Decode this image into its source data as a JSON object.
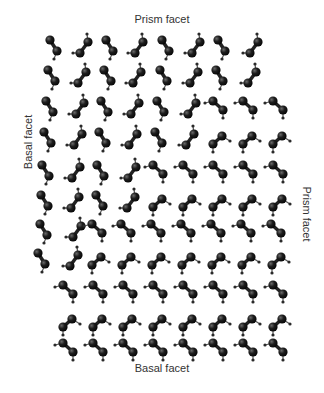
{
  "labels": {
    "top": "Prism facet",
    "bottom": "Basal facet",
    "left": "Basal facet",
    "right": "Prism facet"
  },
  "colors": {
    "oxygen": "#1a1a1a",
    "hydrogen": "#2a2a2a",
    "bond": "#555555",
    "text": "#333333"
  },
  "molecule_types": {
    "A": "prism-orientation-down",
    "B": "prism-orientation-up",
    "C": "basal-orientation-down",
    "D": "basal-orientation-up"
  },
  "rows": [
    {
      "y": 40,
      "molecules": [
        [
          "A",
          50
        ],
        [
          "B",
          80
        ],
        [
          "A",
          106
        ],
        [
          "B",
          135
        ],
        [
          "A",
          162
        ],
        [
          "B",
          192
        ],
        [
          "A",
          218
        ],
        [
          "B",
          250
        ]
      ]
    },
    {
      "y": 70,
      "molecules": [
        [
          "A",
          48
        ],
        [
          "B",
          78
        ],
        [
          "A",
          104
        ],
        [
          "B",
          133
        ],
        [
          "A",
          160
        ],
        [
          "B",
          190
        ],
        [
          "A",
          216
        ],
        [
          "B",
          248
        ]
      ]
    },
    {
      "y": 101,
      "molecules": [
        [
          "A",
          46
        ],
        [
          "B",
          76
        ],
        [
          "A",
          101
        ],
        [
          "B",
          131
        ],
        [
          "A",
          157
        ],
        [
          "B",
          188
        ],
        [
          "C",
          213
        ],
        [
          "C",
          243
        ],
        [
          "C",
          273
        ]
      ]
    },
    {
      "y": 132,
      "molecules": [
        [
          "A",
          44
        ],
        [
          "B",
          74
        ],
        [
          "A",
          99
        ],
        [
          "B",
          129
        ],
        [
          "A",
          155
        ],
        [
          "B",
          186
        ],
        [
          "D",
          213
        ],
        [
          "D",
          243
        ],
        [
          "D",
          273
        ]
      ]
    },
    {
      "y": 165,
      "molecules": [
        [
          "A",
          42
        ],
        [
          "B",
          72
        ],
        [
          "A",
          97
        ],
        [
          "B",
          128
        ],
        [
          "C",
          153
        ],
        [
          "C",
          183
        ],
        [
          "C",
          213
        ],
        [
          "C",
          243
        ],
        [
          "C",
          273
        ]
      ]
    },
    {
      "y": 195,
      "molecules": [
        [
          "A",
          41
        ],
        [
          "B",
          71
        ],
        [
          "A",
          96
        ],
        [
          "B",
          127
        ],
        [
          "D",
          153
        ],
        [
          "D",
          183
        ],
        [
          "D",
          213
        ],
        [
          "D",
          243
        ],
        [
          "D",
          273
        ]
      ]
    },
    {
      "y": 224,
      "molecules": [
        [
          "A",
          40
        ],
        [
          "B",
          73
        ],
        [
          "C",
          92
        ],
        [
          "C",
          121
        ],
        [
          "C",
          151
        ],
        [
          "C",
          181
        ],
        [
          "C",
          211
        ],
        [
          "C",
          241
        ],
        [
          "C",
          271
        ]
      ]
    },
    {
      "y": 253,
      "molecules": [
        [
          "A",
          38
        ],
        [
          "B",
          70
        ],
        [
          "D",
          92
        ],
        [
          "D",
          122
        ],
        [
          "D",
          152
        ],
        [
          "D",
          182
        ],
        [
          "D",
          212
        ],
        [
          "D",
          242
        ],
        [
          "D",
          272
        ]
      ]
    },
    {
      "y": 285,
      "molecules": [
        [
          "C",
          63
        ],
        [
          "C",
          93
        ],
        [
          "C",
          123
        ],
        [
          "C",
          153
        ],
        [
          "C",
          183
        ],
        [
          "C",
          213
        ],
        [
          "C",
          243
        ],
        [
          "C",
          273
        ]
      ]
    },
    {
      "y": 315,
      "molecules": [
        [
          "D",
          63
        ],
        [
          "D",
          93
        ],
        [
          "D",
          123
        ],
        [
          "D",
          153
        ],
        [
          "D",
          183
        ],
        [
          "D",
          213
        ],
        [
          "D",
          243
        ],
        [
          "D",
          273
        ]
      ]
    },
    {
      "y": 343,
      "molecules": [
        [
          "C",
          63
        ],
        [
          "C",
          93
        ],
        [
          "C",
          123
        ],
        [
          "C",
          153
        ],
        [
          "C",
          183
        ],
        [
          "C",
          213
        ],
        [
          "C",
          243
        ],
        [
          "C",
          273
        ]
      ]
    }
  ]
}
